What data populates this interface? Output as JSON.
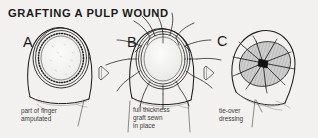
{
  "figure": {
    "title": "GRAFTING  A  PULP  WOUND",
    "background_color": "#f2f1ef",
    "ink_color": "#1d1d1d"
  },
  "panels": [
    {
      "letter": "A",
      "caption_line1": "part of finger",
      "caption_line2": "amputated",
      "caption_line3": ""
    },
    {
      "letter": "B",
      "caption_line1": "full thickness",
      "caption_line2": "graft sewn",
      "caption_line3": "in place"
    },
    {
      "letter": "C",
      "caption_line1": "tie-over",
      "caption_line2": "dressing",
      "caption_line3": ""
    }
  ],
  "arrows": [
    {
      "name": "arrow-a-to-b"
    },
    {
      "name": "arrow-b-to-c"
    }
  ]
}
